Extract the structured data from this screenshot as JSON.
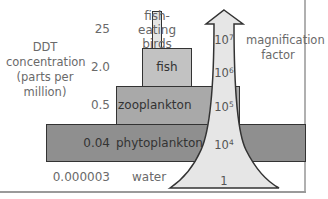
{
  "diagram": {
    "y_axis_title": "DDT concentration (parts per million)",
    "arrow_title": "magnification factor",
    "levels": [
      {
        "organism": "fish-eating birds",
        "concentration": "25",
        "magnification_base": "10",
        "magnification_exp": "7"
      },
      {
        "organism": "fish",
        "concentration": "2.0",
        "magnification_base": "10",
        "magnification_exp": "6"
      },
      {
        "organism": "zooplankton",
        "concentration": "0.5",
        "magnification_base": "10",
        "magnification_exp": "5"
      },
      {
        "organism": "phytoplankton",
        "concentration": "0.04",
        "magnification_base": "10",
        "magnification_exp": "4"
      },
      {
        "organism": "water",
        "concentration": "0.000003",
        "magnification_base": "1",
        "magnification_exp": ""
      }
    ],
    "colors": {
      "birds_bar": "#e4e4e4",
      "fish_bar": "#c2c2c2",
      "zooplankton_bar": "#a9a9a9",
      "phytoplankton_bar": "#8f8f8f",
      "arrow_fill": "#e6e6e6",
      "outline": "#333333"
    }
  }
}
